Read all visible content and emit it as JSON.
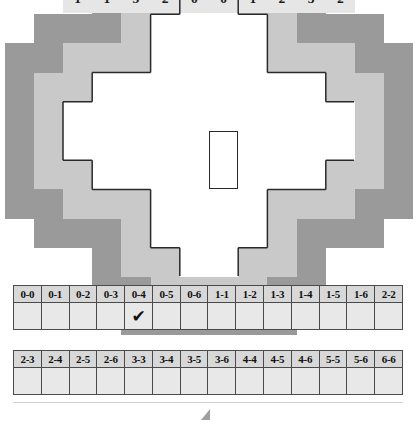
{
  "puzzle": {
    "title": "Dominoes placement puzzle",
    "grid": {
      "columns": 10,
      "rows": 10,
      "cell_colors": {
        "fill": "#e6e6e6",
        "inner_border": "#2a2a2a",
        "mid_frame": "#c9c9c9",
        "outer_frame": "#9a9a9a"
      },
      "row_data": [
        {
          "row": 0,
          "start_col": 4,
          "values": [
            0,
            5
          ]
        },
        {
          "row": 1,
          "start_col": 3,
          "values": [
            0,
            3,
            6,
            6
          ]
        },
        {
          "row": 2,
          "start_col": 3,
          "values": [
            6,
            1,
            1,
            5
          ]
        },
        {
          "row": 3,
          "start_col": 1,
          "values": [
            2,
            2,
            3,
            3,
            4,
            5,
            5,
            3
          ]
        },
        {
          "row": 4,
          "start_col": 0,
          "values": [
            2,
            5,
            6,
            6,
            3,
            2,
            4,
            4,
            6,
            6
          ]
        },
        {
          "row": 5,
          "start_col": 0,
          "values": [
            1,
            1,
            4,
            0,
            1,
            4,
            4,
            4,
            3,
            2
          ]
        },
        {
          "row": 6,
          "start_col": 1,
          "values": [
            1,
            5,
            1,
            6,
            0,
            0,
            2,
            3
          ]
        },
        {
          "row": 7,
          "start_col": 3,
          "values": [
            2,
            3,
            4,
            5
          ]
        },
        {
          "row": 8,
          "start_col": 3,
          "values": [
            2,
            5,
            0,
            1
          ]
        },
        {
          "row": 9,
          "start_col": 4,
          "values": [
            0,
            0
          ]
        }
      ],
      "marked_domino": {
        "label": "0-4",
        "orientation": "vertical",
        "col": 5,
        "row_start": 5,
        "row_end": 6,
        "values": [
          4,
          0
        ]
      }
    },
    "checklist": {
      "row1": {
        "headers": [
          "0-0",
          "0-1",
          "0-2",
          "0-3",
          "0-4",
          "0-5",
          "0-6",
          "1-1",
          "1-2",
          "1-3",
          "1-4",
          "1-5",
          "1-6",
          "2-2"
        ],
        "marks": [
          "",
          "",
          "",
          "",
          "✔",
          "",
          "",
          "",
          "",
          "",
          "",
          "",
          "",
          ""
        ]
      },
      "row2": {
        "headers": [
          "2-3",
          "2-4",
          "2-5",
          "2-6",
          "3-3",
          "3-4",
          "3-5",
          "3-6",
          "4-4",
          "4-5",
          "4-6",
          "5-5",
          "5-6",
          "6-6"
        ],
        "marks": [
          "",
          "",
          "",
          "",
          "",
          "",
          "",
          "",
          "",
          "",
          "",
          "",
          "",
          ""
        ]
      }
    }
  }
}
